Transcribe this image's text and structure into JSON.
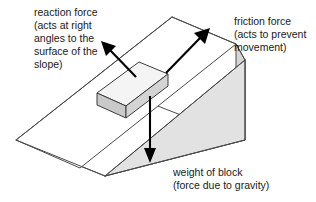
{
  "figure": {
    "title": "Forces acting on a block resting on a slope",
    "background_color": "#ffffff"
  },
  "colors": {
    "slope_top_face": "#ffffff",
    "slope_side_face": "#dcdcdc",
    "slope_front_face": "#e0e0e0",
    "block_top_face": "#f2f2f2",
    "block_front_face": "#d2d2d2",
    "block_end_face": "#c9c9c9",
    "edge_stroke": "#4a4a4a",
    "arrow_color": "#000000",
    "text_color": "#1a1a1a"
  },
  "labels": {
    "reaction": {
      "name": "reaction force",
      "lines": [
        "reaction force",
        "(acts at right",
        "angles to the",
        "surface of the",
        "slope)"
      ]
    },
    "friction": {
      "name": "friction force",
      "lines": [
        "friction force",
        "(acts to prevent",
        "movement)"
      ]
    },
    "weight": {
      "name": "weight of block",
      "lines": [
        "weight of block",
        "(force due to gravity)"
      ]
    }
  },
  "arrows": {
    "reaction": {
      "direction": "up-left, perpendicular to slope surface",
      "from": [
        136,
        77
      ],
      "to": [
        103,
        43
      ]
    },
    "friction": {
      "direction": "up-slope, to the upper right",
      "from": [
        166,
        73
      ],
      "to": [
        209,
        29
      ]
    },
    "weight": {
      "direction": "vertically downward",
      "from": [
        150,
        96
      ],
      "to": [
        150,
        162
      ]
    }
  },
  "shapes": {
    "slope": {
      "type": "wedge / inclined plane",
      "apex": [
        172,
        17
      ]
    },
    "block": {
      "type": "rectangular block resting on slope"
    }
  }
}
